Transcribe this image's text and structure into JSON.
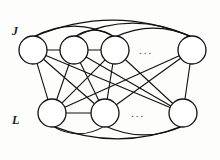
{
  "figure": {
    "background_color": "#fdfdfb",
    "stroke_color": "#111111",
    "node_fill_color": "#ffffff",
    "width": 220,
    "height": 160
  },
  "labels": {
    "top_layer": "J",
    "bottom_layer": "L"
  },
  "ellipsis": {
    "top": "...",
    "bottom": "..."
  },
  "chart_data": {
    "type": "diagram",
    "diagram_kind": "graph",
    "layers": [
      {
        "name": "J",
        "label": "J",
        "label_position": {
          "x": 12,
          "y": 25
        },
        "node_count_visible": 4,
        "ellipsis_after_index": 2,
        "nodes": [
          {
            "id": "j1",
            "cx": 33,
            "cy": 50,
            "r": 14
          },
          {
            "id": "j2",
            "cx": 74,
            "cy": 50,
            "r": 14
          },
          {
            "id": "j3",
            "cx": 115,
            "cy": 50,
            "r": 14
          },
          {
            "id": "j4",
            "cx": 192,
            "cy": 50,
            "r": 14
          }
        ]
      },
      {
        "name": "L",
        "label": "L",
        "label_position": {
          "x": 12,
          "y": 114
        },
        "node_count_visible": 3,
        "ellipsis_after_index": 1,
        "nodes": [
          {
            "id": "l1",
            "cx": 52,
            "cy": 113,
            "r": 14
          },
          {
            "id": "l2",
            "cx": 105,
            "cy": 113,
            "r": 14
          },
          {
            "id": "l3",
            "cx": 183,
            "cy": 113,
            "r": 14
          }
        ]
      }
    ],
    "intra_layer_straight_edges": [
      {
        "from": "j1",
        "to": "j2"
      },
      {
        "from": "j2",
        "to": "j3"
      },
      {
        "from": "l1",
        "to": "l2"
      }
    ],
    "intra_layer_arc_edges": [
      {
        "from": "j1",
        "to": "j3",
        "side": "above",
        "bow": 22
      },
      {
        "from": "j1",
        "to": "j4",
        "side": "above",
        "bow": 34
      },
      {
        "from": "j2",
        "to": "j4",
        "side": "above",
        "bow": 28
      },
      {
        "from": "j3",
        "to": "j4",
        "side": "above",
        "bow": 18
      },
      {
        "from": "j2",
        "to": "j3",
        "side": "above",
        "bow": 14
      },
      {
        "from": "l1",
        "to": "l2",
        "side": "below",
        "bow": 16
      },
      {
        "from": "l1",
        "to": "l3",
        "side": "below",
        "bow": 26
      },
      {
        "from": "l2",
        "to": "l3",
        "side": "below",
        "bow": 18
      }
    ],
    "inter_layer_edges": [
      {
        "from": "j1",
        "to": "l1"
      },
      {
        "from": "j1",
        "to": "l2"
      },
      {
        "from": "j1",
        "to": "l3"
      },
      {
        "from": "j2",
        "to": "l1"
      },
      {
        "from": "j2",
        "to": "l2"
      },
      {
        "from": "j2",
        "to": "l3"
      },
      {
        "from": "j3",
        "to": "l1"
      },
      {
        "from": "j3",
        "to": "l2"
      },
      {
        "from": "j3",
        "to": "l3"
      },
      {
        "from": "j4",
        "to": "l1"
      },
      {
        "from": "j4",
        "to": "l2"
      },
      {
        "from": "j4",
        "to": "l3"
      }
    ]
  }
}
